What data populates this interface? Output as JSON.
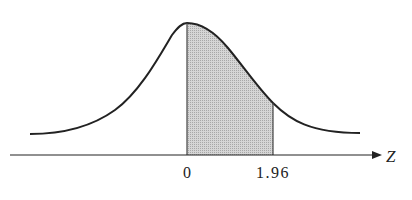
{
  "diagram": {
    "type": "standard-normal-curve",
    "axis_label": "Z",
    "ticks": [
      {
        "label": "0",
        "value": 0
      },
      {
        "label": "1.96",
        "value": 1.96
      }
    ],
    "shaded_region": {
      "from": 0,
      "to": 1.96
    },
    "colors": {
      "curve": "#222222",
      "shade": "#c8c8c8",
      "axis": "#222222"
    }
  }
}
